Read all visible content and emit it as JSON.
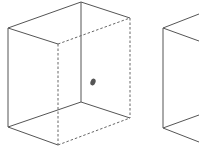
{
  "figure": {
    "width": 199,
    "height": 147,
    "background": "#ffffff",
    "stroke_color": "#555555",
    "dot_color": "#555555",
    "cubes": [
      {
        "name": "cube-1",
        "solid_edges": [
          [
            8,
            28,
            81,
            2
          ],
          [
            81,
            2,
            130,
            18
          ],
          [
            8,
            28,
            58,
            44
          ],
          [
            8,
            28,
            8,
            127
          ],
          [
            81,
            2,
            81,
            102
          ],
          [
            8,
            127,
            81,
            102
          ],
          [
            81,
            102,
            130,
            118
          ],
          [
            8,
            127,
            58,
            145
          ]
        ],
        "dashed_edges": [
          [
            58,
            44,
            130,
            18
          ],
          [
            58,
            44,
            58,
            145
          ],
          [
            130,
            18,
            130,
            118
          ],
          [
            58,
            145,
            130,
            118
          ]
        ],
        "dot": {
          "cx": 93,
          "cy": 82,
          "rx": 2.5,
          "ry": 3.5
        }
      },
      {
        "name": "cube-2-partial",
        "solid_edges": [
          [
            163,
            28,
            199,
            14
          ],
          [
            163,
            28,
            199,
            41
          ],
          [
            163,
            28,
            163,
            128
          ],
          [
            163,
            128,
            199,
            115
          ],
          [
            163,
            128,
            199,
            142
          ]
        ],
        "dashed_edges": []
      }
    ]
  }
}
